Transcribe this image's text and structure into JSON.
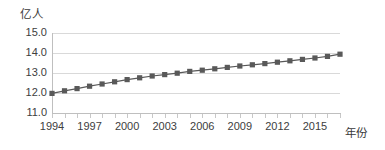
{
  "chart_data": {
    "type": "line",
    "title": "",
    "subtitle": "",
    "xlabel": "年份",
    "ylabel": "亿人",
    "ylim": [
      11.0,
      15.0
    ],
    "xlim": [
      1994,
      2017
    ],
    "grid": true,
    "legend": false,
    "marker": "square",
    "series_color": "#595959",
    "grid_color": "#d9d9d9",
    "y_ticks": [
      "11.0",
      "12.0",
      "13.0",
      "14.0",
      "15.0"
    ],
    "y_tick_values": [
      11.0,
      12.0,
      13.0,
      14.0,
      15.0
    ],
    "x_tick_labels": [
      "1994",
      "1997",
      "2000",
      "2003",
      "2006",
      "2009",
      "2012",
      "2015"
    ],
    "x_tick_values": [
      1994,
      1997,
      2000,
      2003,
      2006,
      2009,
      2012,
      2015
    ],
    "x": [
      1994,
      1995,
      1996,
      1997,
      1998,
      1999,
      2000,
      2001,
      2002,
      2003,
      2004,
      2005,
      2006,
      2007,
      2008,
      2009,
      2010,
      2011,
      2012,
      2013,
      2014,
      2015,
      2016,
      2017
    ],
    "values": [
      11.98,
      12.11,
      12.22,
      12.34,
      12.45,
      12.56,
      12.67,
      12.76,
      12.85,
      12.92,
      12.99,
      13.08,
      13.14,
      13.21,
      13.28,
      13.35,
      13.41,
      13.47,
      13.54,
      13.61,
      13.68,
      13.75,
      13.83,
      13.94
    ],
    "categories": [
      "1994",
      "1995",
      "1996",
      "1997",
      "1998",
      "1999",
      "2000",
      "2001",
      "2002",
      "2003",
      "2004",
      "2005",
      "2006",
      "2007",
      "2008",
      "2009",
      "2010",
      "2011",
      "2012",
      "2013",
      "2014",
      "2015",
      "2016",
      "2017"
    ]
  }
}
